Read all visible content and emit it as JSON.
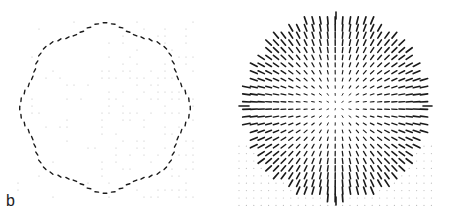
{
  "figure": {
    "panel_label": "b",
    "colors": {
      "ink": "#1a1a1a",
      "faint": "#bdbdbd",
      "background": "#ffffff"
    }
  },
  "left_plot": {
    "description": "Ring of tangentially oriented ticks on a faint dot grid",
    "center": [
      105,
      108
    ],
    "radius": 82,
    "ring_ticks": 64,
    "grid_spacing": 7
  },
  "right_plot": {
    "description": "Disc of radially oriented ticks with crosshair marks",
    "center": [
      111,
      106
    ],
    "radius": 93,
    "grid_spacing": 7.4,
    "crosshair_marks": [
      "top",
      "bottom",
      "left",
      "right"
    ]
  }
}
